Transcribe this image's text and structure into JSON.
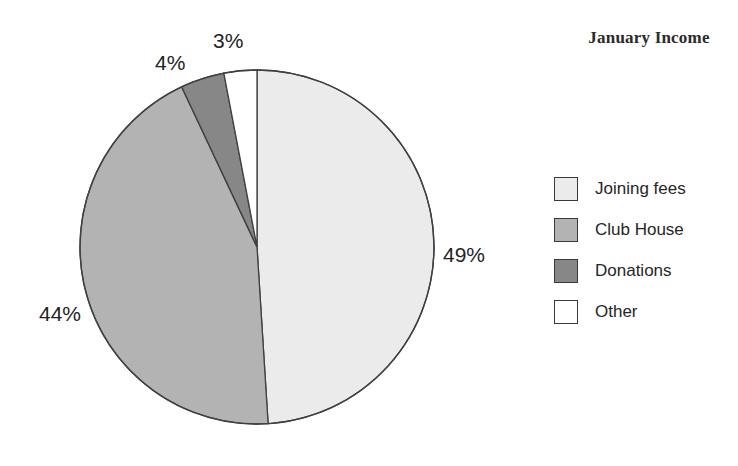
{
  "chart_data": {
    "type": "pie",
    "title": "January Income",
    "xlabel": "",
    "ylabel": "",
    "legend_position": "right",
    "grid": false,
    "start_angle_deg": 0,
    "direction": "clockwise",
    "categories": [
      "Joining fees",
      "Club House",
      "Donations",
      "Other"
    ],
    "values": [
      49,
      44,
      4,
      3
    ],
    "value_unit": "%",
    "data_labels": [
      "49%",
      "44%",
      "4%",
      "3%"
    ],
    "slice_colors": [
      "#ebebeb",
      "#b3b3b3",
      "#878787",
      "#ffffff"
    ],
    "slice_border_color": "#404040",
    "slices": [
      {
        "label": "Joining fees",
        "value": 49,
        "data_label": "49%",
        "color": "#ebebeb"
      },
      {
        "label": "Club House",
        "value": 44,
        "data_label": "44%",
        "color": "#b3b3b3"
      },
      {
        "label": "Donations",
        "value": 4,
        "data_label": "4%",
        "color": "#878787"
      },
      {
        "label": "Other",
        "value": 3,
        "data_label": "3%",
        "color": "#ffffff"
      }
    ]
  },
  "title": {
    "text": "January Income"
  },
  "labels": {
    "joining": "49%",
    "club": "44%",
    "donations": "4%",
    "other": "3%"
  },
  "legend": {
    "items": [
      {
        "label": "Joining fees",
        "color": "#ebebeb"
      },
      {
        "label": "Club House",
        "color": "#b3b3b3"
      },
      {
        "label": "Donations",
        "color": "#878787"
      },
      {
        "label": "Other",
        "color": "#ffffff"
      }
    ]
  }
}
